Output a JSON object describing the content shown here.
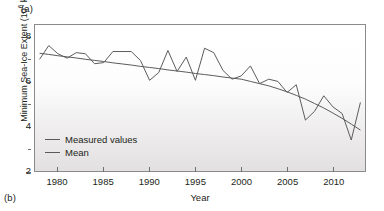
{
  "figure": {
    "panel_label_top": "(a)",
    "panel_label_bottom": "(b)"
  },
  "chart_data": {
    "type": "line",
    "title": "",
    "xlabel": "Year",
    "ylabel": "Minimum Sea-Ice Extent (10⁶ km²)",
    "ylabel_base": "Minimum Sea-Ice Extent (10",
    "ylabel_exp": "6",
    "ylabel_tail": " km²)",
    "xlim": [
      1977.5,
      2013.5
    ],
    "ylim": [
      2,
      8.6
    ],
    "grid": false,
    "legend_position": "lower-left",
    "x_ticks": [
      1980,
      1985,
      1990,
      1995,
      2000,
      2005,
      2010
    ],
    "x_tick_labels": [
      "1980",
      "1985",
      "1990",
      "1995",
      "2000",
      "2005",
      "2010"
    ],
    "x_minor_step": 1,
    "y_ticks": [
      2,
      4,
      6,
      8
    ],
    "y_tick_labels": [
      "2",
      "4",
      "6",
      "8"
    ],
    "y_minor_ticks": [
      3,
      5,
      7
    ],
    "x": [
      1978,
      1979,
      1980,
      1981,
      1982,
      1983,
      1984,
      1985,
      1986,
      1987,
      1988,
      1989,
      1990,
      1991,
      1992,
      1993,
      1994,
      1995,
      1996,
      1997,
      1998,
      1999,
      2000,
      2001,
      2002,
      2003,
      2004,
      2005,
      2006,
      2007,
      2008,
      2009,
      2010,
      2011,
      2012,
      2013
    ],
    "series": [
      {
        "name": "Measured values",
        "color": "#5a5a5a",
        "values": [
          7.05,
          7.67,
          7.3,
          7.1,
          7.35,
          7.3,
          6.85,
          6.9,
          7.4,
          7.4,
          7.4,
          7.0,
          6.1,
          6.45,
          7.45,
          6.5,
          7.15,
          6.1,
          7.55,
          7.35,
          6.55,
          6.15,
          6.3,
          6.75,
          5.95,
          6.15,
          6.05,
          5.55,
          5.9,
          4.3,
          4.7,
          5.4,
          4.9,
          4.6,
          3.4,
          5.1
        ]
      },
      {
        "name": "Mean",
        "color": "#5a5a5a",
        "values": [
          7.32,
          7.27,
          7.21,
          7.16,
          7.11,
          7.05,
          7.0,
          6.95,
          6.89,
          6.84,
          6.79,
          6.73,
          6.68,
          6.63,
          6.57,
          6.52,
          6.47,
          6.41,
          6.36,
          6.31,
          6.25,
          6.2,
          6.15,
          6.05,
          5.95,
          5.85,
          5.72,
          5.58,
          5.42,
          5.25,
          5.05,
          4.85,
          4.62,
          4.38,
          4.12,
          3.85
        ]
      }
    ],
    "legend": [
      {
        "label": "Measured values",
        "color": "#5a5a5a"
      },
      {
        "label": "Mean",
        "color": "#5a5a5a"
      }
    ]
  }
}
